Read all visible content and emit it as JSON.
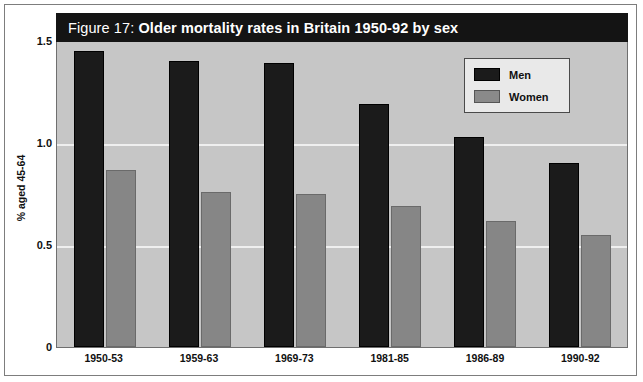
{
  "figure": {
    "title_prefix": "Figure 17: ",
    "title_main": "Older mortality rates in Britain 1950-92 by sex",
    "title_full": "Figure 17: Older mortality rates in Britain 1950-92 by sex"
  },
  "axes": {
    "y_title": "% aged 45-64",
    "y_ticks": [
      "0",
      "0.5",
      "1.0",
      "1.5"
    ]
  },
  "legend": {
    "items": [
      {
        "label": "Men",
        "color": "#1b1b1b"
      },
      {
        "label": "Women",
        "color": "#8a8a8a"
      }
    ]
  },
  "chart_data": {
    "type": "bar",
    "title": "Figure 17: Older mortality rates in Britain 1950-92 by sex",
    "xlabel": "",
    "ylabel": "% aged 45-64",
    "ylim": [
      0,
      1.5
    ],
    "yticks": [
      0,
      0.5,
      1.0,
      1.5
    ],
    "ytick_labels": [
      "0",
      "0.5",
      "1.0",
      "1.5"
    ],
    "grid": true,
    "legend_position": "top-right",
    "categories": [
      "1950-53",
      "1959-63",
      "1969-73",
      "1981-85",
      "1986-89",
      "1990-92"
    ],
    "series": [
      {
        "name": "Men",
        "color": "#1b1b1b",
        "values": [
          1.45,
          1.4,
          1.39,
          1.19,
          1.03,
          0.9
        ]
      },
      {
        "name": "Women",
        "color": "#8a8a8a",
        "values": [
          0.87,
          0.76,
          0.75,
          0.69,
          0.62,
          0.55
        ]
      }
    ]
  }
}
